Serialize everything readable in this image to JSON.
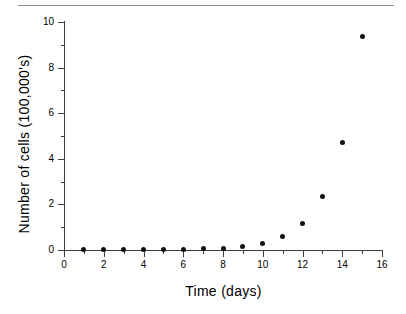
{
  "figure": {
    "top_rule": "horizontal-rule",
    "background_color": "#ffffff",
    "marker_color": "#111111",
    "axis_color": "#3d3d3d"
  },
  "chart_data": {
    "type": "scatter",
    "title": "",
    "xlabel": "Time  (days)",
    "ylabel": "Number of cells  (100,000's)",
    "xlim": [
      0,
      16
    ],
    "ylim": [
      0,
      10
    ],
    "grid": false,
    "legend": null,
    "x_major_ticks": [
      0,
      2,
      4,
      6,
      8,
      10,
      12,
      14,
      16
    ],
    "x_minor_ticks": [
      1,
      3,
      5,
      7,
      9,
      11,
      13,
      15
    ],
    "y_major_ticks": [
      0,
      2,
      4,
      6,
      8,
      10
    ],
    "y_minor_ticks": [
      1,
      3,
      5,
      7,
      9
    ],
    "x_tick_labels": [
      "0",
      "2",
      "4",
      "6",
      "8",
      "10",
      "12",
      "14",
      "16"
    ],
    "y_tick_labels": [
      "0",
      "2",
      "4",
      "6",
      "8",
      "10"
    ],
    "x": [
      1,
      2,
      3,
      4,
      5,
      6,
      7,
      8,
      9,
      10,
      11,
      12,
      13,
      14,
      15
    ],
    "values": [
      0.02,
      0.02,
      0.02,
      0.03,
      0.03,
      0.04,
      0.05,
      0.08,
      0.17,
      0.3,
      0.6,
      1.18,
      2.35,
      4.7,
      9.35
    ],
    "series": [
      {
        "name": "Number of cells",
        "x": [
          1,
          2,
          3,
          4,
          5,
          6,
          7,
          8,
          9,
          10,
          11,
          12,
          13,
          14,
          15
        ],
        "values": [
          0.02,
          0.02,
          0.02,
          0.03,
          0.03,
          0.04,
          0.05,
          0.08,
          0.17,
          0.3,
          0.6,
          1.18,
          2.35,
          4.7,
          9.35
        ]
      }
    ]
  }
}
